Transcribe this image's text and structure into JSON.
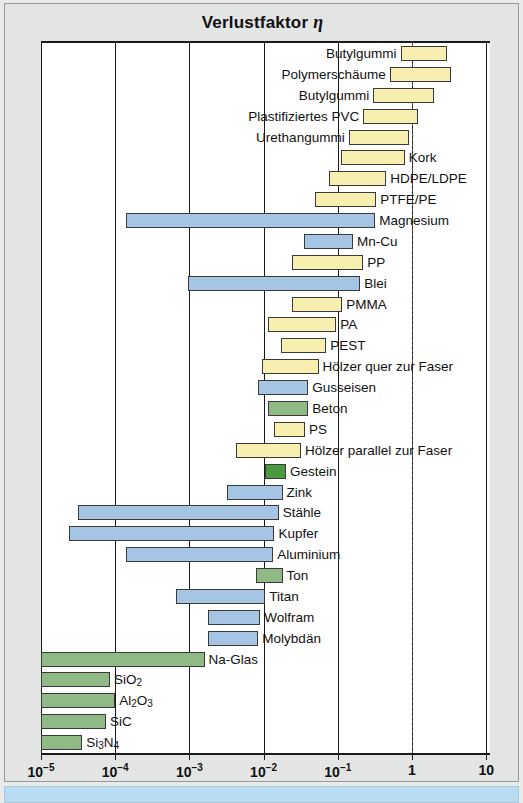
{
  "chart_title": {
    "text": "Verlustfaktor",
    "symbol": "η"
  },
  "axis": {
    "ticks": [
      {
        "label_base": "10",
        "label_exp": "−5",
        "value": 1e-05
      },
      {
        "label_base": "10",
        "label_exp": "−4",
        "value": 0.0001
      },
      {
        "label_base": "10",
        "label_exp": "−3",
        "value": 0.001
      },
      {
        "label_base": "10",
        "label_exp": "−2",
        "value": 0.01
      },
      {
        "label_base": "10",
        "label_exp": "−1",
        "value": 0.1
      },
      {
        "label_base": "1",
        "label_exp": "",
        "value": 1
      },
      {
        "label_base": "10",
        "label_exp": "",
        "value": 10
      }
    ]
  },
  "colors": {
    "polymer": "#f7efb0",
    "metal": "#a6c4e3",
    "ceramic": "#8fba86",
    "stone": "#4c9a3f",
    "bar_outline": "#3a3a3a",
    "axis": "#1a1a1a",
    "page_background": "#e8e9e9",
    "plot_background": "#ffffff",
    "bottom_strip": "#b9dcf2"
  },
  "chart_data": {
    "type": "bar",
    "orientation": "horizontal",
    "title": "Verlustfaktor η",
    "xlabel": "",
    "ylabel": "",
    "xscale": "log",
    "xlim": [
      1e-05,
      10
    ],
    "grid": true,
    "legend": null,
    "note": "Each entry is a range bar (min–max loss coefficient). Category groups: polymer (yellow), metal (blue), ceramic (green), stone (dark green).",
    "bars": [
      {
        "label": "Butylgummi",
        "min": 0.7,
        "max": 3.0,
        "group": "polymer",
        "label_side": "left"
      },
      {
        "label": "Polymerschäume",
        "min": 0.5,
        "max": 3.4,
        "group": "polymer",
        "label_side": "left"
      },
      {
        "label": "Butylgummi",
        "min": 0.3,
        "max": 2.0,
        "group": "polymer",
        "label_side": "left"
      },
      {
        "label": "Plastifiziertes PVC",
        "min": 0.22,
        "max": 1.2,
        "group": "polymer",
        "label_side": "left"
      },
      {
        "label": "Urethangummi",
        "min": 0.14,
        "max": 0.9,
        "group": "polymer",
        "label_side": "left"
      },
      {
        "label": "Kork",
        "min": 0.11,
        "max": 0.8,
        "group": "polymer",
        "label_side": "right"
      },
      {
        "label": "HDPE/LDPE",
        "min": 0.075,
        "max": 0.45,
        "group": "polymer",
        "label_side": "right"
      },
      {
        "label": "PTFE/PE",
        "min": 0.05,
        "max": 0.33,
        "group": "polymer",
        "label_side": "right"
      },
      {
        "label": "Magnesium",
        "min": 0.00014,
        "max": 0.32,
        "group": "metal",
        "label_side": "right"
      },
      {
        "label": "Mn-Cu",
        "min": 0.035,
        "max": 0.16,
        "group": "metal",
        "label_side": "right"
      },
      {
        "label": "PP",
        "min": 0.024,
        "max": 0.22,
        "group": "polymer",
        "label_side": "right"
      },
      {
        "label": "Blei",
        "min": 0.00095,
        "max": 0.2,
        "group": "metal",
        "label_side": "right"
      },
      {
        "label": "PMMA",
        "min": 0.024,
        "max": 0.115,
        "group": "polymer",
        "label_side": "right"
      },
      {
        "label": "PA",
        "min": 0.0115,
        "max": 0.095,
        "group": "polymer",
        "label_side": "right"
      },
      {
        "label": "PEST",
        "min": 0.017,
        "max": 0.07,
        "group": "polymer",
        "label_side": "right"
      },
      {
        "label": "Hölzer quer zur Faser",
        "min": 0.0095,
        "max": 0.055,
        "group": "polymer",
        "label_side": "right"
      },
      {
        "label": "Gusseisen",
        "min": 0.0085,
        "max": 0.04,
        "group": "metal",
        "label_side": "right"
      },
      {
        "label": "Beton",
        "min": 0.0115,
        "max": 0.04,
        "group": "ceramic",
        "label_side": "right"
      },
      {
        "label": "PS",
        "min": 0.014,
        "max": 0.036,
        "group": "polymer",
        "label_side": "right"
      },
      {
        "label": "Hölzer parallel zur Faser",
        "min": 0.0042,
        "max": 0.032,
        "group": "polymer",
        "label_side": "right"
      },
      {
        "label": "Gestein",
        "min": 0.0105,
        "max": 0.02,
        "group": "stone",
        "label_side": "right"
      },
      {
        "label": "Zink",
        "min": 0.0032,
        "max": 0.018,
        "group": "metal",
        "label_side": "right"
      },
      {
        "label": "Stähle",
        "min": 3.2e-05,
        "max": 0.016,
        "group": "metal",
        "label_side": "right"
      },
      {
        "label": "Kupfer",
        "min": 2.4e-05,
        "max": 0.014,
        "group": "metal",
        "label_side": "right"
      },
      {
        "label": "Aluminium",
        "min": 0.00014,
        "max": 0.0135,
        "group": "metal",
        "label_side": "right"
      },
      {
        "label": "Ton",
        "min": 0.008,
        "max": 0.018,
        "group": "ceramic",
        "label_side": "right"
      },
      {
        "label": "Titan",
        "min": 0.00065,
        "max": 0.0105,
        "group": "metal",
        "label_side": "right"
      },
      {
        "label": "Wolfram",
        "min": 0.0018,
        "max": 0.009,
        "group": "metal",
        "label_side": "right"
      },
      {
        "label": "Molybdän",
        "min": 0.0018,
        "max": 0.0085,
        "group": "metal",
        "label_side": "right"
      },
      {
        "label": "Na-Glas",
        "min": 1e-05,
        "max": 0.0016,
        "group": "ceramic",
        "label_side": "right"
      },
      {
        "label": "SiO₂",
        "min": 1e-05,
        "max": 8.5e-05,
        "group": "ceramic",
        "label_side": "right",
        "label_html": "SiO<sub>2</sub>"
      },
      {
        "label": "Al₂O₃",
        "min": 1e-05,
        "max": 0.0001,
        "group": "ceramic",
        "label_side": "right",
        "label_html": "Al<sub>2</sub>O<sub>3</sub>"
      },
      {
        "label": "SiC",
        "min": 1e-05,
        "max": 7.5e-05,
        "group": "ceramic",
        "label_side": "right"
      },
      {
        "label": "Si₃N₄",
        "min": 1e-05,
        "max": 3.6e-05,
        "group": "ceramic",
        "label_side": "right",
        "label_html": "Si<sub>3</sub>N<sub>4</sub>"
      }
    ]
  }
}
